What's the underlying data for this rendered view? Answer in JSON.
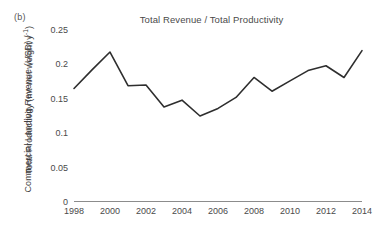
{
  "panel": {
    "label": "(b)"
  },
  "chart_data": {
    "type": "line",
    "title": "Total Revenue / Total Productivity",
    "xlabel": "",
    "ylabel_line1": "Commercial Landing Revenue (USD) /",
    "ylabel_line2_prefix": "Total Productivity (mt wet weight y",
    "ylabel_line2_sup": "-1",
    "ylabel_line2_suffix": ")",
    "x": [
      1998,
      1999,
      2000,
      2001,
      2002,
      2003,
      2004,
      2005,
      2006,
      2007,
      2008,
      2009,
      2010,
      2011,
      2012,
      2013,
      2014
    ],
    "values": [
      0.165,
      0.192,
      0.218,
      0.169,
      0.17,
      0.138,
      0.148,
      0.125,
      0.136,
      0.152,
      0.181,
      0.161,
      0.176,
      0.191,
      0.198,
      0.181,
      0.22
    ],
    "series": [
      {
        "name": "Total Revenue / Total Productivity",
        "values": [
          0.165,
          0.192,
          0.218,
          0.169,
          0.17,
          0.138,
          0.148,
          0.125,
          0.136,
          0.152,
          0.181,
          0.161,
          0.176,
          0.191,
          0.198,
          0.181,
          0.22
        ]
      }
    ],
    "xlim": [
      1998,
      2014
    ],
    "ylim": [
      0,
      0.25
    ],
    "xticks": [
      1998,
      2000,
      2002,
      2004,
      2006,
      2008,
      2010,
      2012,
      2014
    ],
    "xtick_labels": [
      "1998",
      "2000",
      "2002",
      "2004",
      "2006",
      "2008",
      "2010",
      "2012",
      "2014"
    ],
    "yticks": [
      0,
      0.05,
      0.1,
      0.15,
      0.2,
      0.25
    ],
    "ytick_labels": [
      "0",
      "0.05",
      "0.1",
      "0.15",
      "0.2",
      "0.25"
    ],
    "grid": false,
    "legend": "none",
    "line_color": "#2e2e2e",
    "axis_color": "#8c8c8c",
    "background": "#ffffff"
  }
}
